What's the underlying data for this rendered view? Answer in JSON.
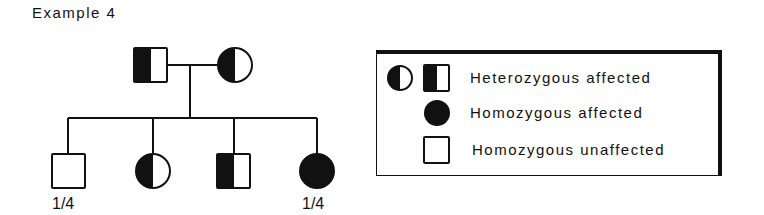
{
  "title": "Example 4",
  "pedigree": {
    "parents": [
      {
        "id": "father",
        "sex": "male",
        "status": "heterozygous affected"
      },
      {
        "id": "mother",
        "sex": "female",
        "status": "heterozygous affected"
      }
    ],
    "children": [
      {
        "id": "child-1",
        "sex": "male",
        "status": "homozygous unaffected",
        "label": "1/4"
      },
      {
        "id": "child-2",
        "sex": "female",
        "status": "heterozygous affected",
        "label": ""
      },
      {
        "id": "child-3",
        "sex": "male",
        "status": "heterozygous affected",
        "label": ""
      },
      {
        "id": "child-4",
        "sex": "female",
        "status": "homozygous affected",
        "label": "1/4"
      }
    ]
  },
  "legend": {
    "items": [
      {
        "label": "Heterozygous affected",
        "symbols": [
          "half-filled-circle",
          "half-filled-square"
        ]
      },
      {
        "label": "Homozygous affected",
        "symbols": [
          "filled-circle"
        ]
      },
      {
        "label": "Homozygous unaffected",
        "symbols": [
          "empty-square"
        ]
      }
    ]
  },
  "colors": {
    "ink": "#111111",
    "background": "#ffffff"
  }
}
